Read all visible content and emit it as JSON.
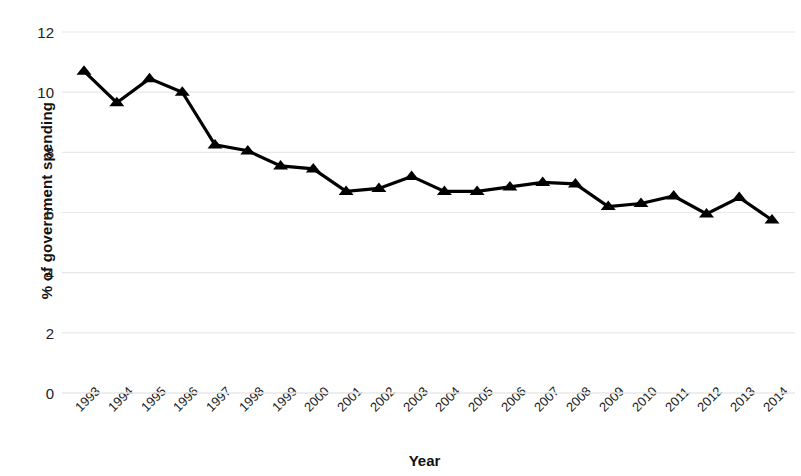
{
  "chart_data": {
    "type": "line",
    "title": "",
    "xlabel": "Year",
    "ylabel": "% of government spending",
    "categories": [
      "1993",
      "1994",
      "1995",
      "1996",
      "1997",
      "1998",
      "1999",
      "2000",
      "2001",
      "2002",
      "2003",
      "2004",
      "2005",
      "2006",
      "2007",
      "2008",
      "2009",
      "2010",
      "2011",
      "2012",
      "2013",
      "2014"
    ],
    "values": [
      10.7,
      9.65,
      10.45,
      10.0,
      8.25,
      8.05,
      7.55,
      7.45,
      6.7,
      6.8,
      7.2,
      6.7,
      6.7,
      6.85,
      7.0,
      6.95,
      6.2,
      6.3,
      6.55,
      5.95,
      6.5,
      5.75
    ],
    "series": [
      {
        "name": "% of government spending",
        "values": [
          10.7,
          9.65,
          10.45,
          10.0,
          8.25,
          8.05,
          7.55,
          7.45,
          6.7,
          6.8,
          7.2,
          6.7,
          6.7,
          6.85,
          7.0,
          6.95,
          6.2,
          6.3,
          6.55,
          5.95,
          6.5,
          5.75
        ]
      }
    ],
    "ylim": [
      0,
      12
    ],
    "yticks": [
      "0",
      "2",
      "4",
      "6",
      "8",
      "10",
      "12"
    ],
    "ytick_values": [
      0,
      2,
      4,
      6,
      8,
      10,
      12
    ],
    "grid": true,
    "grid_axis": "y",
    "legend": "none",
    "marker": "triangle",
    "line_color": "#000000",
    "marker_color": "#000000",
    "grid_color": "#e8e8e8",
    "background": "#ffffff",
    "xtick_rotation": -45
  }
}
